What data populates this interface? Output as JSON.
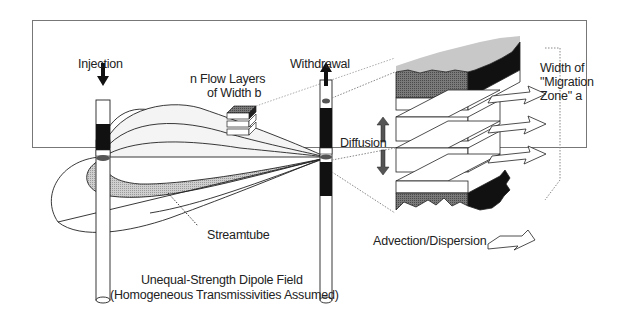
{
  "diagram": {
    "type": "schematic",
    "labels": {
      "injection": "Injection",
      "withdrawal": "Withdrawal",
      "flow_layers_line1": "n Flow Layers",
      "flow_layers_line2": "of Width b",
      "width_line1": "Width of",
      "width_line2": "\"Migration",
      "width_line3": "Zone\" a",
      "diffusion": "Diffusion",
      "streamtube": "Streamtube",
      "advection": "Advection/Dispersion",
      "caption_line1": "Unequal-Strength Dipole Field",
      "caption_line2": "(Homogeneous Transmissivities Assumed)"
    },
    "elements": [
      {
        "id": "injection-well",
        "kind": "well",
        "flow": "down"
      },
      {
        "id": "withdrawal-well",
        "kind": "well",
        "flow": "up"
      },
      {
        "id": "dipole-field",
        "kind": "flow-lines",
        "count": 7
      },
      {
        "id": "streamtube",
        "kind": "shaded-tube"
      },
      {
        "id": "layer-stack-small",
        "kind": "inset-block"
      },
      {
        "id": "layer-stack-large",
        "kind": "magnified-block",
        "layers": 4
      },
      {
        "id": "diffusion-arrows",
        "kind": "vertical-arrows"
      },
      {
        "id": "advection-arrows",
        "kind": "horizontal-arrows",
        "count": 3
      }
    ],
    "colors": {
      "ink": "#222222",
      "shade_light": "#c8c8c8",
      "shade_mid": "#8a8a8a",
      "shade_dark": "#111111",
      "background": "#ffffff",
      "frame": "#777777"
    }
  }
}
